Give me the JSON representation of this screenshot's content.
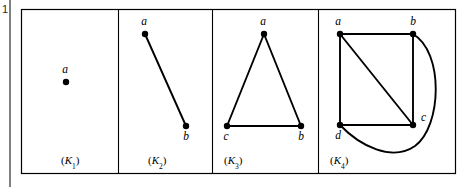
{
  "figure": {
    "margin_number": "1",
    "background_color": "#ffffff",
    "ink_color": "#000000",
    "frame": {
      "x": 21,
      "y": 9,
      "width": 434,
      "height": 164
    },
    "margin_rule": {
      "x": 10,
      "y_top": 0,
      "y_bottom": 187
    },
    "dividers": [
      118,
      212,
      318
    ],
    "panels": [
      {
        "id": "K1",
        "label": "(K",
        "label_sub": "1",
        "label_close": ")",
        "label_x": 61,
        "label_y": 164,
        "vertices": [
          {
            "name": "a",
            "x": 66,
            "y": 82,
            "label_dx": -1,
            "label_dy": -9,
            "anchor": "middle"
          }
        ],
        "edges": [],
        "arcs": []
      },
      {
        "id": "K2",
        "label": "(K",
        "label_sub": "2",
        "label_close": ")",
        "label_x": 148,
        "label_y": 164,
        "vertices": [
          {
            "name": "a",
            "x": 145,
            "y": 34,
            "label_dx": -1,
            "label_dy": -9,
            "anchor": "middle"
          },
          {
            "name": "b",
            "x": 186,
            "y": 126,
            "label_dx": 0,
            "label_dy": 14,
            "anchor": "middle"
          }
        ],
        "edges": [
          {
            "from": "a",
            "to": "b"
          }
        ],
        "arcs": []
      },
      {
        "id": "K3",
        "label": "(K",
        "label_sub": "3",
        "label_close": ")",
        "label_x": 224,
        "label_y": 164,
        "vertices": [
          {
            "name": "a",
            "x": 264,
            "y": 34,
            "label_dx": -1,
            "label_dy": -9,
            "anchor": "middle"
          },
          {
            "name": "c",
            "x": 227,
            "y": 126,
            "label_dx": -1,
            "label_dy": 14,
            "anchor": "middle"
          },
          {
            "name": "b",
            "x": 301,
            "y": 126,
            "label_dx": 0,
            "label_dy": 14,
            "anchor": "middle"
          }
        ],
        "edges": [
          {
            "from": "a",
            "to": "c"
          },
          {
            "from": "a",
            "to": "b"
          },
          {
            "from": "c",
            "to": "b"
          }
        ],
        "arcs": []
      },
      {
        "id": "K4",
        "label": "(K",
        "label_sub": "4",
        "label_close": ")",
        "label_x": 330,
        "label_y": 164,
        "vertices": [
          {
            "name": "a",
            "x": 340,
            "y": 34,
            "label_dx": -2,
            "label_dy": -9,
            "anchor": "middle"
          },
          {
            "name": "b",
            "x": 413,
            "y": 34,
            "label_dx": 0,
            "label_dy": -9,
            "anchor": "middle"
          },
          {
            "name": "c",
            "x": 413,
            "y": 125,
            "label_dx": 8,
            "label_dy": -4,
            "anchor": "start"
          },
          {
            "name": "d",
            "x": 340,
            "y": 125,
            "label_dx": -2,
            "label_dy": 14,
            "anchor": "middle"
          }
        ],
        "edges": [
          {
            "from": "a",
            "to": "b"
          },
          {
            "from": "a",
            "to": "d"
          },
          {
            "from": "a",
            "to": "c"
          },
          {
            "from": "b",
            "to": "c"
          },
          {
            "from": "d",
            "to": "c"
          }
        ],
        "arcs": [
          {
            "from": "b",
            "to": "d",
            "path": "M 413 34 C 444 52 442 126 415 146 C 392 162 360 146 340 125"
          }
        ]
      }
    ]
  }
}
